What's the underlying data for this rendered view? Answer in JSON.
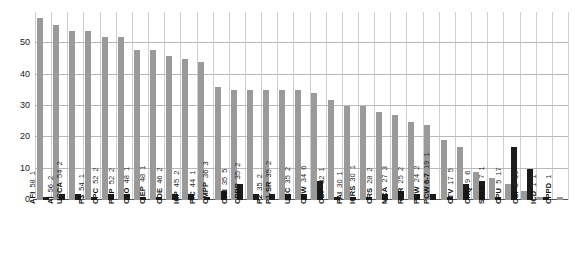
{
  "chart_data": {
    "type": "bar",
    "title": "",
    "subtitle": "",
    "xlabel": "",
    "ylabel": "",
    "ylim": [
      0,
      60
    ],
    "yticks": [
      0,
      10,
      20,
      30,
      40,
      50
    ],
    "grid": "both",
    "legend": "none",
    "orientation": "vertical",
    "bar_grouping": "grouped",
    "categories": [
      "AFI",
      "AI",
      "UCCA",
      "P3",
      "CPC",
      "PCP",
      "CEO",
      "CIEP",
      "CDE",
      "ICP",
      "PIC",
      "CMPP",
      "CWI",
      "CPPP",
      "P2",
      "P1-SR",
      "UCC",
      "CPW",
      "CDP",
      "PAI",
      "ICRS",
      "CRS",
      "MCA",
      "RCR",
      "PCW",
      "PCW 6-7",
      "CTV",
      "CRQ",
      "SPHC",
      "CPU",
      "CSI",
      "ICD",
      "CPPD"
    ],
    "series": [
      {
        "name": "series-1",
        "color": "#9a9a9a",
        "values": [
          58,
          56,
          54,
          54,
          52,
          52,
          48,
          48,
          46,
          45,
          44,
          36,
          35,
          35,
          35,
          35,
          35,
          34,
          32,
          30,
          30,
          28,
          27,
          25,
          24,
          19,
          17,
          9,
          7,
          5,
          3,
          1,
          1
        ]
      },
      {
        "name": "series-2",
        "color": "#1b1b1b",
        "values": [
          1,
          2,
          2,
          1,
          2,
          2,
          1,
          1,
          2,
          2,
          1,
          3,
          5,
          2,
          2,
          2,
          2,
          6,
          1,
          1,
          1,
          2,
          3,
          2,
          2,
          1,
          5,
          6,
          1,
          17,
          10,
          1,
          null
        ]
      }
    ],
    "point_labels": [
      {
        "category": "AFI",
        "v1": "58",
        "v2": "1"
      },
      {
        "category": "AI",
        "v1": "56",
        "v2": "2"
      },
      {
        "category": "UCCA",
        "v1": "54",
        "v2": "2"
      },
      {
        "category": "P3",
        "v1": "54",
        "v2": "1"
      },
      {
        "category": "CPC",
        "v1": "52",
        "v2": "2"
      },
      {
        "category": "PCP",
        "v1": "52",
        "v2": "2"
      },
      {
        "category": "CEO",
        "v1": "48",
        "v2": "1"
      },
      {
        "category": "CIEP",
        "v1": "48",
        "v2": "1"
      },
      {
        "category": "CDE",
        "v1": "46",
        "v2": "2"
      },
      {
        "category": "ICP",
        "v1": "45",
        "v2": "2"
      },
      {
        "category": "PIC",
        "v1": "44",
        "v2": "1"
      },
      {
        "category": "CMPP",
        "v1": "36",
        "v2": "3"
      },
      {
        "category": "CWI",
        "v1": "35",
        "v2": "5"
      },
      {
        "category": "CPPP",
        "v1": "35",
        "v2": "2"
      },
      {
        "category": "P2",
        "v1": "35",
        "v2": "2"
      },
      {
        "category": "P1-SR",
        "v1": "35",
        "v2": "2"
      },
      {
        "category": "UCC",
        "v1": "35",
        "v2": "2"
      },
      {
        "category": "CPW",
        "v1": "34",
        "v2": "6"
      },
      {
        "category": "CDP",
        "v1": "32",
        "v2": "1"
      },
      {
        "category": "PAI",
        "v1": "30",
        "v2": "1"
      },
      {
        "category": "ICRS",
        "v1": "30",
        "v2": "1"
      },
      {
        "category": "CRS",
        "v1": "28",
        "v2": "2"
      },
      {
        "category": "MCA",
        "v1": "27",
        "v2": "3"
      },
      {
        "category": "RCR",
        "v1": "25",
        "v2": "2"
      },
      {
        "category": "PCW",
        "v1": "24",
        "v2": "2"
      },
      {
        "category": "PCW 6-7",
        "v1": "19",
        "v2": "1"
      },
      {
        "category": "CTV",
        "v1": "17",
        "v2": "5"
      },
      {
        "category": "CRQ",
        "v1": "9",
        "v2": "6"
      },
      {
        "category": "SPHC",
        "v1": "7",
        "v2": "1"
      },
      {
        "category": "CPU",
        "v1": "5",
        "v2": "17"
      },
      {
        "category": "CSI",
        "v1": "3",
        "v2": "10"
      },
      {
        "category": "ICD",
        "v1": "1",
        "v2": "1"
      },
      {
        "category": "CPPD",
        "v1": "1",
        "v2": ""
      }
    ]
  },
  "colors": {
    "series1": "#9a9a9a",
    "series2": "#1b1b1b",
    "grid": "#cfcfcf",
    "axis": "#555555",
    "text": "#111111",
    "background": "#ffffff"
  }
}
